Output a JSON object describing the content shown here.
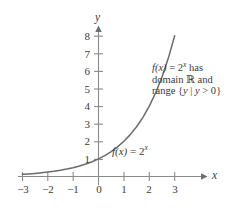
{
  "figure": {
    "axis_x_name": "x",
    "axis_y_name": "y",
    "curve_label_fn": "f(x)",
    "curve_label_eq": " = 2",
    "curve_label_exp": "x",
    "annotation": {
      "line1_fn": "f(x)",
      "line1_eq": " = 2",
      "line1_exp": "x",
      "line1_tail": "  has",
      "line2_pre": "domain ",
      "line2_set": "ℝ",
      "line2_post": " and",
      "line3_pre": "range ",
      "line3_open": "{",
      "line3_var1": "y",
      "line3_bar": " | ",
      "line3_var2": "y",
      "line3_rel": " > 0",
      "line3_close": "}"
    },
    "colors": {
      "curve": "#6b6b6b",
      "axis": "#8a8a8a",
      "text": "#3b3b3b",
      "background": "#ffffff"
    }
  },
  "chart_data": {
    "type": "line",
    "title": "",
    "xlabel": "x",
    "ylabel": "y",
    "function": "f(x) = 2^x",
    "domain": "R",
    "range": "{y | y > 0}",
    "xlim": [
      -3.2,
      3.4
    ],
    "ylim": [
      -0.35,
      8.6
    ],
    "grid": false,
    "legend": "none",
    "xticks": [
      -3,
      -2,
      -1,
      0,
      1,
      2,
      3
    ],
    "xtick_labels": [
      "−3",
      "−2",
      "−1",
      "0",
      "1",
      "2",
      "3"
    ],
    "yticks": [
      1,
      2,
      3,
      4,
      5,
      6,
      7,
      8
    ],
    "ytick_labels": [
      "1",
      "2",
      "3",
      "4",
      "5",
      "6",
      "7",
      "8"
    ],
    "x": [
      -3,
      -2.75,
      -2.5,
      -2.25,
      -2,
      -1.75,
      -1.5,
      -1.25,
      -1,
      -0.75,
      -0.5,
      -0.25,
      0,
      0.25,
      0.5,
      0.75,
      1,
      1.25,
      1.5,
      1.75,
      2,
      2.25,
      2.5,
      2.75,
      3
    ],
    "values": [
      0.125,
      0.1487,
      0.1768,
      0.2102,
      0.25,
      0.2973,
      0.3536,
      0.4204,
      0.5,
      0.5946,
      0.7071,
      0.8409,
      1,
      1.1892,
      1.4142,
      1.6818,
      2,
      2.3784,
      2.8284,
      3.3636,
      4,
      4.7568,
      5.6569,
      6.7272,
      8
    ],
    "annotations": [
      {
        "text": "f(x) = 2^x",
        "x": 0.8,
        "y": 1.55
      },
      {
        "text": "f(x) = 2^x has domain R and range {y | y > 0}",
        "x": 2.1,
        "y": 7.2
      }
    ]
  }
}
